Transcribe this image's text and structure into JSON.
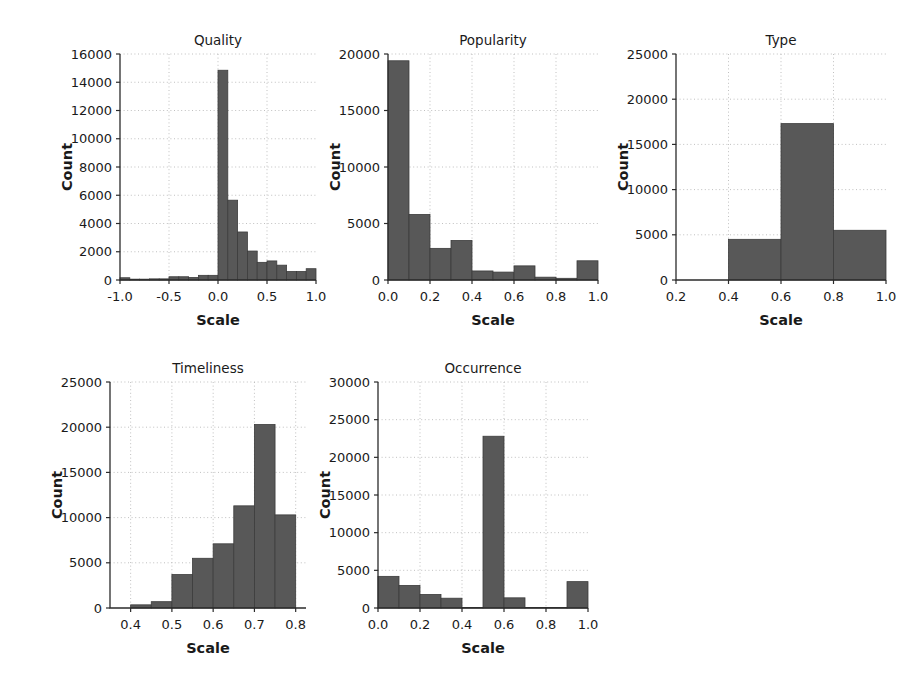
{
  "figure": {
    "background": "#ffffff",
    "bar_color": "#585858",
    "bar_edge_color": "#3c3c3c",
    "grid_color": "#b9b9b9",
    "axis_color": "#2b2b2b"
  },
  "chart_data": [
    {
      "type": "bar",
      "title": "Quality",
      "xlabel": "Scale",
      "ylabel": "Count",
      "grid": true,
      "xlim": [
        -1.0,
        1.0
      ],
      "ylim": [
        0,
        16000
      ],
      "xticks": [
        "-1.0",
        "-0.5",
        "0.0",
        "0.5",
        "1.0"
      ],
      "xtick_values": [
        -1.0,
        -0.5,
        0.0,
        0.5,
        1.0
      ],
      "yticks": [
        "0",
        "2000",
        "4000",
        "6000",
        "8000",
        "10000",
        "12000",
        "14000",
        "16000"
      ],
      "ytick_values": [
        0,
        2000,
        4000,
        6000,
        8000,
        10000,
        12000,
        14000,
        16000
      ],
      "bin_edges": [
        -1.0,
        -0.9,
        -0.8,
        -0.7,
        -0.6,
        -0.5,
        -0.4,
        -0.3,
        -0.2,
        -0.1,
        0.0,
        0.1,
        0.2,
        0.3,
        0.4,
        0.5,
        0.6,
        0.7,
        0.8,
        0.9,
        1.0
      ],
      "values": [
        160,
        60,
        60,
        80,
        80,
        230,
        230,
        180,
        330,
        330,
        14850,
        5650,
        3400,
        2050,
        1250,
        1350,
        1050,
        600,
        600,
        800,
        500
      ]
    },
    {
      "type": "bar",
      "title": "Popularity",
      "xlabel": "Scale",
      "ylabel": "Count",
      "grid": true,
      "xlim": [
        0.0,
        1.0
      ],
      "ylim": [
        0,
        20000
      ],
      "xticks": [
        "0.0",
        "0.2",
        "0.4",
        "0.6",
        "0.8",
        "1.0"
      ],
      "xtick_values": [
        0.0,
        0.2,
        0.4,
        0.6,
        0.8,
        1.0
      ],
      "yticks": [
        "0",
        "5000",
        "10000",
        "15000",
        "20000"
      ],
      "ytick_values": [
        0,
        5000,
        10000,
        15000,
        20000
      ],
      "bin_edges": [
        0.0,
        0.1,
        0.2,
        0.3,
        0.4,
        0.5,
        0.6,
        0.7,
        0.8,
        0.9,
        1.0
      ],
      "values": [
        19400,
        5800,
        2800,
        3500,
        800,
        700,
        1250,
        250,
        150,
        1700
      ]
    },
    {
      "type": "bar",
      "title": "Type",
      "xlabel": "Scale",
      "ylabel": "Count",
      "grid": true,
      "xlim": [
        0.2,
        1.0
      ],
      "ylim": [
        0,
        25000
      ],
      "xticks": [
        "0.2",
        "0.4",
        "0.6",
        "0.8",
        "1.0"
      ],
      "xtick_values": [
        0.2,
        0.4,
        0.6,
        0.8,
        1.0
      ],
      "yticks": [
        "0",
        "5000",
        "10000",
        "15000",
        "20000",
        "25000"
      ],
      "ytick_values": [
        0,
        5000,
        10000,
        15000,
        20000,
        25000
      ],
      "bin_edges": [
        0.4,
        0.6,
        0.8,
        1.0
      ],
      "values": [
        4500,
        17300,
        5500
      ]
    },
    {
      "type": "bar",
      "title": "Timeliness",
      "xlabel": "Scale",
      "ylabel": "Count",
      "grid": true,
      "xlim": [
        0.35,
        0.825
      ],
      "ylim": [
        0,
        25000
      ],
      "xticks": [
        "0.4",
        "0.5",
        "0.6",
        "0.7",
        "0.8"
      ],
      "xtick_values": [
        0.4,
        0.5,
        0.6,
        0.7,
        0.8
      ],
      "yticks": [
        "0",
        "5000",
        "10000",
        "15000",
        "20000",
        "25000"
      ],
      "ytick_values": [
        0,
        5000,
        10000,
        15000,
        20000,
        25000
      ],
      "bin_edges": [
        0.4,
        0.45,
        0.5,
        0.55,
        0.6,
        0.65,
        0.7,
        0.75,
        0.8
      ],
      "values": [
        350,
        700,
        3700,
        5500,
        7100,
        11300,
        20300,
        10300
      ]
    },
    {
      "type": "bar",
      "title": "Occurrence",
      "xlabel": "Scale",
      "ylabel": "Count",
      "grid": true,
      "xlim": [
        0.0,
        1.0
      ],
      "ylim": [
        0,
        30000
      ],
      "xticks": [
        "0.0",
        "0.2",
        "0.4",
        "0.6",
        "0.8",
        "1.0"
      ],
      "xtick_values": [
        0.0,
        0.2,
        0.4,
        0.6,
        0.8,
        1.0
      ],
      "yticks": [
        "0",
        "5000",
        "10000",
        "15000",
        "20000",
        "25000",
        "30000"
      ],
      "ytick_values": [
        0,
        5000,
        10000,
        15000,
        20000,
        25000,
        30000
      ],
      "bin_edges": [
        0.0,
        0.1,
        0.2,
        0.3,
        0.4,
        0.5,
        0.6,
        0.7,
        0.8,
        0.9,
        1.0
      ],
      "values": [
        4200,
        3000,
        1800,
        1300,
        60,
        22800,
        1350,
        60,
        60,
        3500
      ]
    }
  ],
  "panels": [
    {
      "key": "quality",
      "left": 58,
      "top": 28,
      "width": 268,
      "height": 310
    },
    {
      "key": "popularity",
      "left": 326,
      "top": 28,
      "width": 282,
      "height": 310
    },
    {
      "key": "type",
      "left": 614,
      "top": 28,
      "width": 282,
      "height": 310
    },
    {
      "key": "timeliness",
      "left": 48,
      "top": 356,
      "width": 268,
      "height": 310
    },
    {
      "key": "occurrence",
      "left": 316,
      "top": 356,
      "width": 282,
      "height": 310
    }
  ]
}
